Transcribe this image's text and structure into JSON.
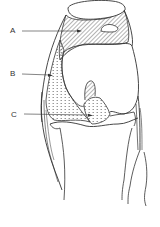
{
  "diagram": {
    "colors": {
      "line": "#333333",
      "background": "#ffffff"
    },
    "labels": [
      {
        "id": "A",
        "text": "A",
        "x": 10,
        "y": 27,
        "points_to": "hatched region above femoral condyle (anterior/suprapatellar area)"
      },
      {
        "id": "B",
        "text": "B",
        "x": 10,
        "y": 70,
        "points_to": "dotted region along lateral/medial femur side"
      },
      {
        "id": "C",
        "text": "C",
        "x": 11,
        "y": 111,
        "points_to": "dotted region at intercondylar area near tibial plateau"
      }
    ]
  }
}
